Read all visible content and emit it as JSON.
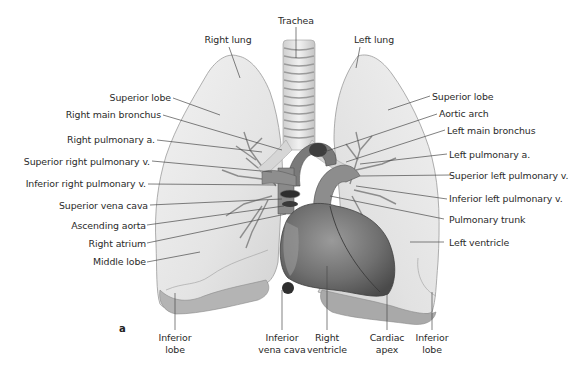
{
  "figure": {
    "panel_letter": "a",
    "colors": {
      "lung_fill": "#e9e9e9",
      "lung_shadow": "#b9b9b9",
      "heart_fill": "#7d7d7d",
      "heart_dark": "#4e4e4e",
      "vessel_fill": "#8c8c8c",
      "leader_line": "#4a4a4a",
      "label_text": "#2a2a2a"
    }
  },
  "labels": {
    "top": {
      "trachea": "Trachea",
      "right_lung": "Right lung",
      "left_lung": "Left lung"
    },
    "left": [
      "Superior lobe",
      "Right main bronchus",
      "Right pulmonary a.",
      "Superior right pulmonary v.",
      "Inferior right pulmonary v.",
      "Superior vena cava",
      "Ascending aorta",
      "Right atrium",
      "Middle lobe"
    ],
    "right": [
      "Superior lobe",
      "Aortic arch",
      "Left main bronchus",
      "Left pulmonary a.",
      "Superior left pulmonary v.",
      "Inferior left pulmonary v.",
      "Pulmonary trunk",
      "Left ventricle"
    ],
    "bottom": [
      {
        "line1": "Inferior",
        "line2": "lobe"
      },
      {
        "line1": "Inferior",
        "line2": "vena cava"
      },
      {
        "line1": "Right",
        "line2": "ventricle"
      },
      {
        "line1": "Cardiac",
        "line2": "apex"
      },
      {
        "line1": "Inferior",
        "line2": "lobe"
      }
    ]
  }
}
